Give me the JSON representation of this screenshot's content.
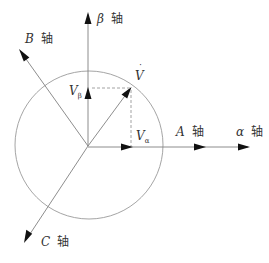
{
  "diagram": {
    "title": "",
    "type": "vector-coordinate-diagram",
    "axes": {
      "beta": {
        "symbol": "β",
        "suffix": "轴"
      },
      "B": {
        "symbol": "B",
        "suffix": "轴"
      },
      "A": {
        "symbol": "A",
        "suffix": "轴"
      },
      "alpha": {
        "symbol": "α",
        "suffix": "轴"
      },
      "C": {
        "symbol": "C",
        "suffix": "轴"
      }
    },
    "vectors": {
      "V": {
        "symbol": "V",
        "accent": "˙"
      },
      "V_alpha": {
        "symbol": "V",
        "subscript": "α"
      },
      "V_beta": {
        "symbol": "V",
        "subscript": "β"
      }
    },
    "colors": {
      "lines": "#808080",
      "circle": "#9a9a9a",
      "arrowheads": "#111111",
      "text": "#333333"
    }
  }
}
